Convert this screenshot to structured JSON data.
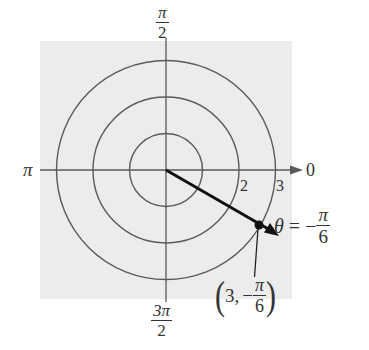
{
  "diagram": {
    "background_color": "#ececec",
    "line_color": "#555555",
    "vector_color": "#111111",
    "center": {
      "x": 166,
      "y": 170
    },
    "unit_radius_px": 36.5,
    "circles": [
      {
        "r": 1
      },
      {
        "r": 2
      },
      {
        "r": 3
      }
    ],
    "axis_labels": {
      "top": {
        "numerator": "π",
        "denominator": "2"
      },
      "bottom": {
        "numerator": "3π",
        "denominator": "2"
      },
      "left": "π",
      "right": "0"
    },
    "radial_ticks": [
      "2",
      "3"
    ],
    "point": {
      "r": 3,
      "theta": "-π/6",
      "label_open": "(",
      "label_r": "3,",
      "label_sign": "−",
      "label_num": "π",
      "label_den": "6",
      "label_close": ")"
    },
    "angle_label": {
      "symbol": "θ",
      "equals": " = −",
      "numerator": "π",
      "denominator": "6"
    }
  }
}
